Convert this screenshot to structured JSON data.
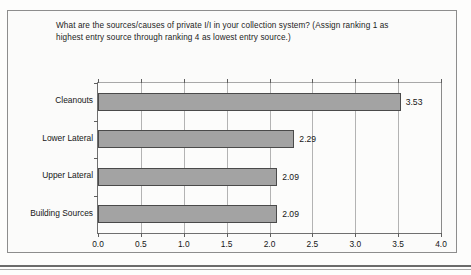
{
  "chart_data": {
    "type": "bar",
    "orientation": "horizontal",
    "title": "What are the sources/causes of private I/I in your collection system? (Assign ranking 1 as highest entry source through ranking 4 as lowest entry source.)",
    "categories": [
      "Cleanouts",
      "Lower Lateral",
      "Upper Lateral",
      "Building Sources"
    ],
    "values": [
      3.53,
      2.29,
      2.09,
      2.09
    ],
    "value_labels": [
      "3.53",
      "2.29",
      "2.09",
      "2.09"
    ],
    "xlabel": "",
    "ylabel": "",
    "xlim": [
      0.0,
      4.0
    ],
    "xticks": [
      0.0,
      0.5,
      1.0,
      1.5,
      2.0,
      2.5,
      3.0,
      3.5,
      4.0
    ],
    "xtick_labels": [
      "0.0",
      "0.5",
      "1.0",
      "1.5",
      "2.0",
      "2.5",
      "3.0",
      "3.5",
      "4.0"
    ],
    "grid": true,
    "legend": false,
    "bar_color": "#a3a3a3",
    "bar_edge_color": "#4a4a4a",
    "plot_background": "#fcfcfb",
    "frame_color": "#8d8d8d"
  }
}
